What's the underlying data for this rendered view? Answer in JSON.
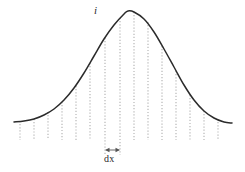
{
  "figure": {
    "caption_peak_label": "i",
    "caption_strip_label": "dx",
    "background_color": "#ffffff",
    "curve_color": "#2b2b2b",
    "dotted_line_color": "#b0b0b0",
    "bracket_color": "#555555",
    "label_color": "#2b2b2b",
    "width": 245,
    "height": 172
  },
  "chart_data": {
    "type": "line",
    "title": "",
    "subtitle": "",
    "xlabel": "",
    "ylabel": "",
    "grid": false,
    "legend_position": "none",
    "xlim": [
      14,
      232
    ],
    "ylim": [
      11,
      140
    ],
    "baseline_y": 140,
    "peak": {
      "x": 128,
      "y": 11
    },
    "curve_endpoints": [
      {
        "x": 14,
        "y": 122
      },
      {
        "x": 232,
        "y": 123
      }
    ],
    "series": [
      {
        "name": "bell-curve",
        "x": [
          14,
          24,
          34,
          44,
          54,
          64,
          74,
          84,
          94,
          104,
          114,
          124,
          128,
          134,
          144,
          154,
          164,
          174,
          184,
          194,
          204,
          214,
          224,
          232
        ],
        "y": [
          122,
          121,
          119,
          115,
          109,
          100,
          88,
          73,
          56,
          39,
          25,
          14,
          11,
          12,
          19,
          32,
          49,
          67,
          85,
          100,
          111,
          118,
          122,
          123
        ]
      }
    ],
    "ordinate_lines": [
      {
        "index": 0,
        "x": 20,
        "y_top": 121,
        "y_bottom": 140
      },
      {
        "index": 1,
        "x": 34,
        "y_top": 119,
        "y_bottom": 140
      },
      {
        "index": 2,
        "x": 48,
        "y_top": 112,
        "y_bottom": 140
      },
      {
        "index": 3,
        "x": 62,
        "y_top": 102,
        "y_bottom": 140
      },
      {
        "index": 4,
        "x": 76,
        "y_top": 86,
        "y_bottom": 140
      },
      {
        "index": 5,
        "x": 90,
        "y_top": 63,
        "y_bottom": 140
      },
      {
        "index": 6,
        "x": 105,
        "y_top": 38,
        "y_bottom": 155
      },
      {
        "index": 7,
        "x": 120,
        "y_top": 18,
        "y_bottom": 155
      },
      {
        "index": 8,
        "x": 134,
        "y_top": 12,
        "y_bottom": 140
      },
      {
        "index": 9,
        "x": 148,
        "y_top": 22,
        "y_bottom": 140
      },
      {
        "index": 10,
        "x": 162,
        "y_top": 46,
        "y_bottom": 140
      },
      {
        "index": 11,
        "x": 176,
        "y_top": 71,
        "y_bottom": 140
      },
      {
        "index": 12,
        "x": 190,
        "y_top": 95,
        "y_bottom": 140
      },
      {
        "index": 13,
        "x": 204,
        "y_top": 111,
        "y_bottom": 140
      },
      {
        "index": 14,
        "x": 218,
        "y_top": 119,
        "y_bottom": 140
      }
    ],
    "annotations": [
      {
        "name": "peak-height-label",
        "text": "i",
        "x": 97,
        "y": 12,
        "style": "italic"
      },
      {
        "name": "strip-width-label",
        "text": "dx",
        "x": 112,
        "y": 160,
        "style": "normal"
      }
    ],
    "dx_arrow": {
      "y": 150,
      "x_left": 105,
      "x_right": 120,
      "double_headed": true
    }
  }
}
